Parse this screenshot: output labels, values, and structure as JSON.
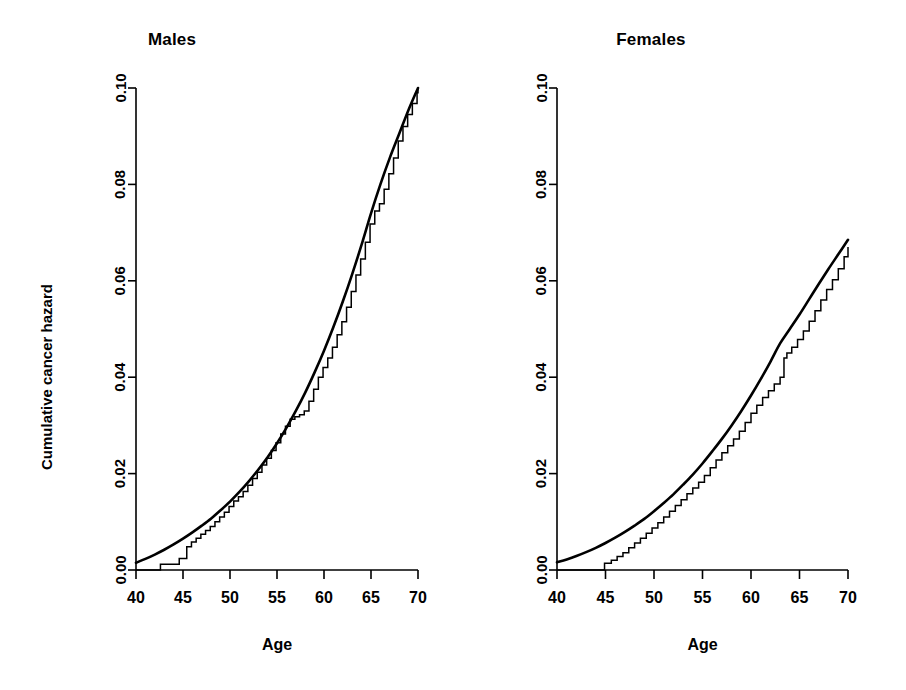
{
  "figure": {
    "width": 906,
    "height": 690,
    "background": "#ffffff",
    "ink_color": "#000000"
  },
  "chart_data": [
    {
      "type": "line",
      "title": "Males",
      "xlabel": "Age",
      "ylabel": "Cumulative cancer hazard",
      "xlim": [
        40,
        70
      ],
      "ylim": [
        0.0,
        0.1
      ],
      "xticks": [
        40,
        45,
        50,
        55,
        60,
        65,
        70
      ],
      "xticklabels": [
        "40",
        "45",
        "50",
        "55",
        "60",
        "65",
        "70"
      ],
      "yticks": [
        0.0,
        0.02,
        0.04,
        0.06,
        0.08,
        0.1
      ],
      "yticklabels": [
        "0.00",
        "0.02",
        "0.04",
        "0.06",
        "0.08",
        "0.10"
      ],
      "grid": false,
      "legend": "none",
      "series": [
        {
          "name": "fitted parametric cumulative hazard",
          "style": "smooth",
          "x": [
            40,
            41,
            42,
            43,
            44,
            45,
            46,
            47,
            48,
            49,
            50,
            51,
            52,
            53,
            54,
            55,
            56,
            57,
            58,
            59,
            60,
            61,
            62,
            63,
            64,
            65,
            66,
            67,
            68,
            69,
            70
          ],
          "values": [
            0.0015,
            0.0023,
            0.0032,
            0.0042,
            0.0053,
            0.0065,
            0.0078,
            0.0092,
            0.0107,
            0.0124,
            0.0142,
            0.0162,
            0.0184,
            0.0208,
            0.0234,
            0.0263,
            0.0295,
            0.033,
            0.0368,
            0.041,
            0.0455,
            0.0504,
            0.0557,
            0.0614,
            0.0675,
            0.074,
            0.08,
            0.0855,
            0.0905,
            0.0955,
            0.1
          ]
        },
        {
          "name": "Nelson-Aalen cumulative hazard estimate",
          "style": "step",
          "x": [
            40,
            42.2,
            42.6,
            43.2,
            44.6,
            45.1,
            45.4,
            45.9,
            46.4,
            46.9,
            47.4,
            47.9,
            48.4,
            48.9,
            49.4,
            49.9,
            50.4,
            50.9,
            51.4,
            51.9,
            52.4,
            52.9,
            53.4,
            53.9,
            54.4,
            54.9,
            55.4,
            55.9,
            56.4,
            56.9,
            57.4,
            57.9,
            58.4,
            58.9,
            59.4,
            59.9,
            60.4,
            60.9,
            61.4,
            61.9,
            62.4,
            62.9,
            63.4,
            63.9,
            64.4,
            64.9,
            65.4,
            65.9,
            66.4,
            66.9,
            67.4,
            67.9,
            68.4,
            68.9,
            69.4,
            69.9,
            70
          ],
          "values": [
            0.0,
            0.0,
            0.0012,
            0.0012,
            0.0024,
            0.0024,
            0.0048,
            0.0058,
            0.0066,
            0.0074,
            0.0082,
            0.009,
            0.01,
            0.011,
            0.012,
            0.0132,
            0.0143,
            0.0152,
            0.0163,
            0.0176,
            0.019,
            0.0203,
            0.0218,
            0.0232,
            0.0248,
            0.0264,
            0.0282,
            0.0298,
            0.0313,
            0.0318,
            0.0322,
            0.033,
            0.035,
            0.0375,
            0.04,
            0.042,
            0.044,
            0.0462,
            0.0488,
            0.0515,
            0.0545,
            0.0578,
            0.0612,
            0.0645,
            0.068,
            0.0718,
            0.0745,
            0.076,
            0.079,
            0.0822,
            0.0855,
            0.089,
            0.092,
            0.0945,
            0.0968,
            0.099,
            0.1
          ]
        }
      ]
    },
    {
      "type": "line",
      "title": "Females",
      "xlabel": "Age",
      "ylabel": "",
      "xlim": [
        40,
        70
      ],
      "ylim": [
        0.0,
        0.1
      ],
      "xticks": [
        40,
        45,
        50,
        55,
        60,
        65,
        70
      ],
      "xticklabels": [
        "40",
        "45",
        "50",
        "55",
        "60",
        "65",
        "70"
      ],
      "yticks": [
        0.0,
        0.02,
        0.04,
        0.06,
        0.08,
        0.1
      ],
      "yticklabels": [
        "0.00",
        "0.02",
        "0.04",
        "0.06",
        "0.08",
        "0.10"
      ],
      "grid": false,
      "legend": "none",
      "series": [
        {
          "name": "fitted parametric cumulative hazard",
          "style": "smooth",
          "x": [
            40,
            41,
            42,
            43,
            44,
            45,
            46,
            47,
            48,
            49,
            50,
            51,
            52,
            53,
            54,
            55,
            56,
            57,
            58,
            59,
            60,
            61,
            62,
            63,
            64,
            65,
            66,
            67,
            68,
            69,
            70
          ],
          "values": [
            0.0016,
            0.0022,
            0.0029,
            0.0037,
            0.0046,
            0.0056,
            0.0067,
            0.0079,
            0.0092,
            0.0106,
            0.0122,
            0.0139,
            0.0157,
            0.0177,
            0.0198,
            0.0221,
            0.0246,
            0.0272,
            0.03,
            0.033,
            0.0362,
            0.0396,
            0.0432,
            0.047,
            0.05,
            0.053,
            0.0562,
            0.0594,
            0.0625,
            0.0655,
            0.0685
          ]
        },
        {
          "name": "Nelson-Aalen cumulative hazard estimate",
          "style": "step",
          "x": [
            40,
            44.4,
            44.9,
            45.6,
            46.2,
            46.8,
            47.4,
            48.0,
            48.6,
            49.2,
            49.8,
            50.4,
            51.0,
            51.6,
            52.2,
            52.8,
            53.4,
            54.0,
            54.6,
            55.2,
            55.8,
            56.4,
            57.0,
            57.6,
            58.2,
            58.8,
            59.4,
            60.0,
            60.6,
            61.2,
            61.8,
            62.4,
            63.0,
            63.4,
            63.7,
            64.2,
            64.8,
            65.4,
            66.0,
            66.6,
            67.2,
            67.8,
            68.4,
            69.0,
            69.6,
            70
          ],
          "values": [
            0.0,
            0.0,
            0.0014,
            0.002,
            0.0028,
            0.0036,
            0.0046,
            0.0056,
            0.0066,
            0.0076,
            0.0087,
            0.0098,
            0.011,
            0.0122,
            0.0134,
            0.0146,
            0.0158,
            0.017,
            0.0182,
            0.0196,
            0.0212,
            0.0228,
            0.0243,
            0.0258,
            0.0272,
            0.0288,
            0.0306,
            0.0325,
            0.0342,
            0.0358,
            0.0372,
            0.0386,
            0.04,
            0.044,
            0.045,
            0.0462,
            0.0478,
            0.0496,
            0.0516,
            0.0538,
            0.056,
            0.0582,
            0.0602,
            0.0625,
            0.065,
            0.067
          ]
        }
      ]
    }
  ],
  "panels": {
    "males": {
      "title": "Males",
      "xlabel": "Age",
      "ylabel": "Cumulative cancer hazard"
    },
    "females": {
      "title": "Females",
      "xlabel": "Age",
      "ylabel": ""
    }
  }
}
